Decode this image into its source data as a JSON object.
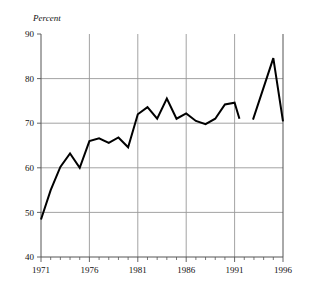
{
  "chart_data": {
    "type": "line",
    "title": "",
    "subtitle": "",
    "xlabel": "",
    "ylabel": "Percent",
    "ylim": [
      40,
      90
    ],
    "xlim": [
      1971,
      1996
    ],
    "grid": true,
    "legend": "none",
    "y_ticks": [
      40,
      50,
      60,
      70,
      80,
      90
    ],
    "y_tick_labels": [
      "40",
      "50",
      "60",
      "70",
      "80",
      "90"
    ],
    "x_ticks": [
      1971,
      1976,
      1981,
      1986,
      1991,
      1996
    ],
    "x_tick_labels": [
      "1971",
      "1976",
      "1981",
      "1986",
      "1991",
      "1996"
    ],
    "x_minor_tick_step": 1,
    "series": [
      {
        "name": "Percent",
        "color": "#000000",
        "segments": [
          {
            "x": [
              1971,
              1972,
              1973,
              1974,
              1975,
              1976,
              1977,
              1978,
              1979,
              1980,
              1981,
              1982,
              1983,
              1984,
              1985,
              1986,
              1987,
              1988,
              1989,
              1990,
              1991,
              1991.5
            ],
            "y": [
              48.4,
              55.0,
              60.2,
              63.2,
              60.0,
              66.0,
              66.6,
              65.6,
              66.8,
              64.6,
              72.0,
              73.6,
              71.0,
              75.5,
              71.0,
              72.2,
              70.5,
              69.8,
              71.0,
              74.2,
              74.6,
              71.0
            ]
          },
          {
            "x": [
              1992.9,
              1995.0,
              1996.0
            ],
            "y": [
              70.8,
              84.6,
              70.4
            ]
          }
        ]
      }
    ]
  },
  "axis_label": {
    "y_title": "Percent"
  },
  "colors": {
    "line": "#000000",
    "grid": "#999999",
    "axis": "#555555",
    "text": "#111111"
  }
}
